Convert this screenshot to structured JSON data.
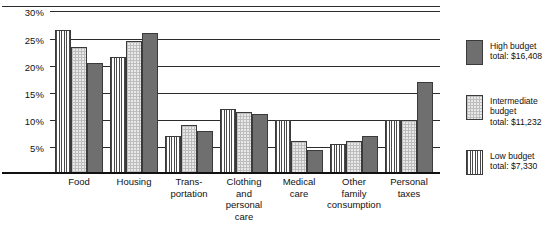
{
  "chart_data": {
    "type": "bar",
    "title": "",
    "xlabel": "",
    "ylabel": "",
    "ylim": [
      0,
      31
    ],
    "grid": true,
    "legend_position": "right",
    "y_ticks": [
      "30%",
      "25%",
      "20%",
      "15%",
      "10%",
      "5%"
    ],
    "y_tick_values": [
      30,
      25,
      20,
      15,
      10,
      5
    ],
    "categories": [
      "Food",
      "Housing",
      "Transportation",
      "Clothing and personal care",
      "Medical care",
      "Other family consumption",
      "Personal taxes"
    ],
    "category_label_lines": [
      [
        "Food"
      ],
      [
        "Housing"
      ],
      [
        "Trans-",
        "portation"
      ],
      [
        "Clothing",
        "and",
        "personal",
        "care"
      ],
      [
        "Medical",
        "care"
      ],
      [
        "Other",
        "family",
        "consumption"
      ],
      [
        "Personal",
        "taxes"
      ]
    ],
    "series": [
      {
        "name": "Low budget",
        "pattern": "vertical-stripes",
        "color": "#4a4a4a",
        "values": [
          26.5,
          21.5,
          7.0,
          12.0,
          10.0,
          5.5,
          10.0
        ]
      },
      {
        "name": "Intermediate budget",
        "pattern": "dotted",
        "color": "#d8d8d8",
        "values": [
          23.5,
          24.5,
          9.0,
          11.5,
          6.0,
          6.0,
          10.0
        ]
      },
      {
        "name": "High budget",
        "pattern": "solid",
        "color": "#6f6f6f",
        "values": [
          20.5,
          26.0,
          8.0,
          11.0,
          4.5,
          7.0,
          17.0
        ]
      }
    ]
  },
  "legend": {
    "items": [
      {
        "swatch": "high-budget-swatch",
        "line1": "High budget",
        "line2": "total: $16,408",
        "line3": ""
      },
      {
        "swatch": "intermediate-budget-swatch",
        "line1": "Intermediate",
        "line2": "budget",
        "line3": "total: $11,232"
      },
      {
        "swatch": "low-budget-swatch",
        "line1": "Low budget",
        "line2": "total: $7,330",
        "line3": ""
      }
    ]
  }
}
